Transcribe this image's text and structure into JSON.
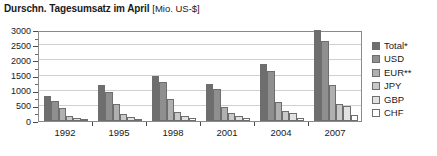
{
  "title": {
    "main": "Durschn. Tagesumsatz im April",
    "unit": "[Mio. US-$]"
  },
  "footnote": "",
  "chart_data": {
    "type": "bar",
    "title": "Durschn. Tagesumsatz im April [Mio. US-$]",
    "xlabel": "",
    "ylabel": "Mio. US-$",
    "ylim": [
      0,
      3000
    ],
    "ytick_values": [
      0,
      500,
      1000,
      1500,
      2000,
      2500,
      3000
    ],
    "ytick_labels": [
      "0",
      "500",
      "1000",
      "1500",
      "2000",
      "2500",
      "3000"
    ],
    "grid": true,
    "legend_position": "right",
    "categories": [
      "1992",
      "1995",
      "1998",
      "2001",
      "2004",
      "2007"
    ],
    "series": [
      {
        "name": "Total*",
        "color": "#6e6e6e",
        "values": [
          820,
          1190,
          1500,
          1210,
          1880,
          3000
        ]
      },
      {
        "name": "USD",
        "color": "#8f8f8f",
        "values": [
          650,
          950,
          1270,
          1070,
          1640,
          2640
        ]
      },
      {
        "name": "EUR**",
        "color": "#b0b0b0",
        "values": [
          420,
          570,
          710,
          470,
          620,
          1200
        ]
      },
      {
        "name": "JPY",
        "color": "#c9c9c9",
        "values": [
          180,
          230,
          290,
          250,
          330,
          560
        ]
      },
      {
        "name": "GBP",
        "color": "#e2e2e2",
        "values": [
          110,
          140,
          180,
          180,
          280,
          490
        ]
      },
      {
        "name": "CHF",
        "color": "#ffffff",
        "values": [
          55,
          70,
          85,
          90,
          110,
          190
        ]
      }
    ]
  }
}
